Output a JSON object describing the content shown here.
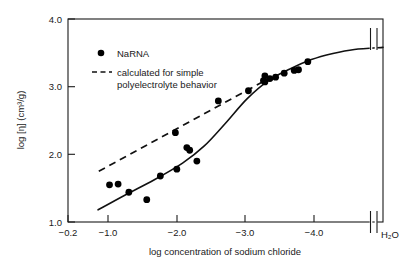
{
  "chart_data": {
    "type": "line",
    "title": "",
    "xlabel": "log concentration of sodium chloride",
    "ylabel": "log [η]  (cm³/g)",
    "xlim": [
      -0.2,
      -4.6
    ],
    "ylim": [
      1.0,
      4.0
    ],
    "x_ticks": [
      -0.2,
      -1.0,
      -2.0,
      -3.0,
      -4.0
    ],
    "x_tick_labels": [
      "−0.2",
      "−1.0",
      "−2.0",
      "−3.0",
      "−4.0"
    ],
    "y_ticks": [
      1.0,
      2.0,
      3.0,
      4.0
    ],
    "y_tick_labels": [
      "1.0",
      "2.0",
      "3.0",
      "4.0"
    ],
    "grid": false,
    "axis_break": {
      "present": true,
      "axis": "x",
      "position": -4.45,
      "label": "H₂O"
    },
    "legend": {
      "position": "upper-left-inside",
      "entries": [
        {
          "label": "NaRNA",
          "marker": "filled-circle",
          "style": "solid"
        },
        {
          "label": "calculated for simple",
          "label_line2": "polyelectrolyte behavior",
          "marker": "none",
          "style": "dashed"
        }
      ]
    },
    "series": [
      {
        "name": "NaRNA",
        "style": "points-with-fitted-curve",
        "marker": "filled-circle",
        "points": [
          {
            "x": -1.3,
            "y": 1.33
          },
          {
            "x": -1.05,
            "y": 1.44
          },
          {
            "x": -0.9,
            "y": 1.56
          },
          {
            "x": -0.78,
            "y": 1.55
          },
          {
            "x": -1.49,
            "y": 1.68
          },
          {
            "x": -1.72,
            "y": 1.78
          },
          {
            "x": -2.0,
            "y": 1.9
          },
          {
            "x": -1.9,
            "y": 2.06
          },
          {
            "x": -1.86,
            "y": 2.1
          },
          {
            "x": -1.7,
            "y": 2.32
          },
          {
            "x": -2.3,
            "y": 2.79
          },
          {
            "x": -2.72,
            "y": 2.94
          },
          {
            "x": -2.95,
            "y": 3.07
          },
          {
            "x": -2.93,
            "y": 3.09
          },
          {
            "x": -2.95,
            "y": 3.16
          },
          {
            "x": -3.02,
            "y": 3.12
          },
          {
            "x": -3.1,
            "y": 3.14
          },
          {
            "x": -3.22,
            "y": 3.2
          },
          {
            "x": -3.36,
            "y": 3.24
          },
          {
            "x": -3.42,
            "y": 3.25
          },
          {
            "x": -3.55,
            "y": 3.37
          }
        ],
        "curve": [
          {
            "x": -0.62,
            "y": 1.18
          },
          {
            "x": -1.0,
            "y": 1.4
          },
          {
            "x": -1.4,
            "y": 1.62
          },
          {
            "x": -1.8,
            "y": 1.87
          },
          {
            "x": -2.1,
            "y": 2.12
          },
          {
            "x": -2.4,
            "y": 2.46
          },
          {
            "x": -2.7,
            "y": 2.82
          },
          {
            "x": -3.0,
            "y": 3.09
          },
          {
            "x": -3.3,
            "y": 3.26
          },
          {
            "x": -3.6,
            "y": 3.4
          },
          {
            "x": -3.9,
            "y": 3.49
          },
          {
            "x": -4.2,
            "y": 3.55
          },
          {
            "x": -4.6,
            "y": 3.58
          }
        ]
      },
      {
        "name": "calculated for simple polyelectrolyte behavior",
        "style": "dashed-line",
        "marker": "none",
        "endpoints": [
          {
            "x": -0.63,
            "y": 1.75
          },
          {
            "x": -3.02,
            "y": 3.13
          }
        ]
      }
    ]
  },
  "figure": {
    "x_axis_title": "log concentration of sodium chloride",
    "y_axis_title": "log [η]  (cm³/g)",
    "water_label": "H₂O",
    "legend_narna": "NaRNA",
    "legend_calc_line1": "calculated for simple",
    "legend_calc_line2": "polyelectrolyte behavior",
    "ytick_1": "1.0",
    "ytick_2": "2.0",
    "ytick_3": "3.0",
    "ytick_4": "4.0",
    "xtick_1": "−0.2",
    "xtick_2": "−1.0",
    "xtick_3": "−2.0",
    "xtick_4": "−3.0",
    "xtick_5": "−4.0"
  },
  "colors": {
    "ink": "#1a1a1a",
    "data": "#000000",
    "background": "#ffffff"
  }
}
